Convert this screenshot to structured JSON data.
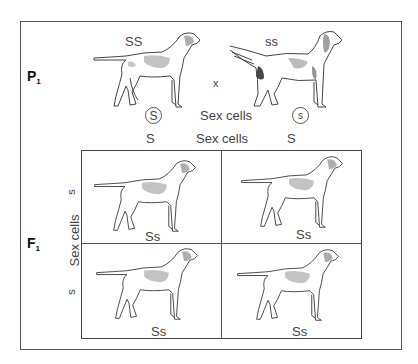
{
  "figure": {
    "generations": {
      "p1": {
        "label": "P",
        "subscript": "1"
      },
      "f1": {
        "label": "F",
        "subscript": "1"
      }
    },
    "parents": [
      {
        "genotype": "SS",
        "gamete": "S",
        "coat": "short-hair pointer"
      },
      {
        "genotype": "ss",
        "gamete": "s",
        "coat": "long-hair setter"
      }
    ],
    "cross_symbol": "x",
    "sex_cells_label": "Sex cells",
    "punnett": {
      "top_label": "Sex cells",
      "side_label": "Sex cells",
      "columns": [
        "S",
        "S"
      ],
      "rows": [
        "s",
        "s"
      ],
      "cells": [
        [
          "Ss",
          "Ss"
        ],
        [
          "Ss",
          "Ss"
        ]
      ]
    },
    "colors": {
      "line": "#555555",
      "text": "#444444",
      "shade": "#9a9a9a"
    }
  }
}
